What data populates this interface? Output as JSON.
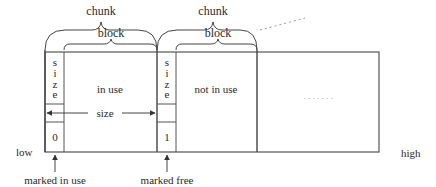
{
  "labels": {
    "chunk_1": "chunk",
    "chunk_2": "chunk",
    "block_1": "block",
    "block_2": "block",
    "size_vertical_1": [
      "s",
      "i",
      "z",
      "e"
    ],
    "size_vertical_2": [
      "s",
      "i",
      "z",
      "e"
    ],
    "in_use": "in use",
    "not_in_use": "not in use",
    "ellipsis": ". . . . . . .",
    "size_span": "size",
    "flag_1": "0",
    "flag_2": "1",
    "low": "low",
    "high": "high",
    "marked_in_use": "marked in use",
    "marked_free": "marked free"
  },
  "colors": {
    "line": "#555555",
    "text": "#2a2a2a",
    "dots": "#9a9a9a"
  }
}
